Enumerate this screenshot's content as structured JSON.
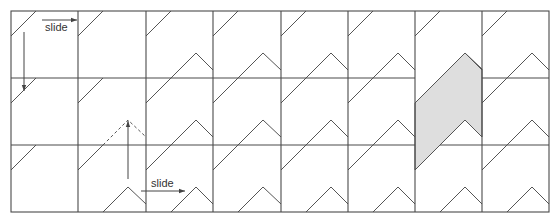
{
  "diagram": {
    "title": "",
    "grid": {
      "origin_x": 11,
      "origin_y": 11,
      "col_edges": [
        11,
        78,
        146,
        213,
        281,
        348,
        415,
        482,
        549
      ],
      "row_edges": [
        11,
        78,
        145,
        212
      ],
      "columns": 8,
      "rows": 3
    },
    "colors": {
      "line": "#4a4a4a",
      "shade": "#dedede",
      "background": "#ffffff"
    },
    "motif": {
      "short_diagonal": "from (x0, y0+25) to (x0+25, y0)",
      "chevron": "from (x0+25, y0+67) up to peak (x0+50, y0+42) down to (x0+67, y0+59)"
    },
    "cells_with_chevron": {
      "row1": [
        3,
        4,
        5,
        6,
        7,
        8
      ],
      "row2": [
        3,
        4,
        5,
        6,
        7,
        8
      ],
      "row3": [
        2,
        3,
        4,
        5,
        6,
        7,
        8
      ]
    },
    "dashed_chevron": {
      "row": 2,
      "col": 2
    },
    "shaded_tile": {
      "column": 7,
      "points": [
        [
          465,
          53
        ],
        [
          482,
          69
        ],
        [
          482,
          137
        ],
        [
          465,
          120
        ],
        [
          415,
          170
        ],
        [
          415,
          103
        ]
      ]
    },
    "annotations": [
      {
        "id": "slide-top",
        "text": "slide",
        "type": "horizontal-arrow",
        "from": [
          42,
          20
        ],
        "to": [
          77,
          20
        ],
        "label_pos": [
          45,
          23
        ]
      },
      {
        "id": "slide-down",
        "text": "",
        "type": "vertical-arrow",
        "from": [
          24,
          32
        ],
        "to": [
          24,
          91
        ]
      },
      {
        "id": "slide-up",
        "text": "",
        "type": "vertical-arrow",
        "from": [
          128,
          179
        ],
        "to": [
          128,
          121
        ]
      },
      {
        "id": "slide-bottom",
        "text": "slide",
        "type": "horizontal-arrow",
        "from": [
          141,
          191
        ],
        "to": [
          185,
          191
        ],
        "label_pos": [
          151,
          178
        ]
      }
    ]
  },
  "labels": {
    "slide_top": "slide",
    "slide_bottom": "slide"
  }
}
